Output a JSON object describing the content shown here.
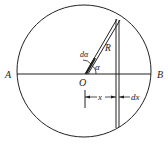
{
  "diagram": {
    "labels": {
      "point_a": "A",
      "point_b": "B",
      "center": "O",
      "radius": "R",
      "angle": "α",
      "angle_increment": "dα",
      "distance": "x",
      "distance_increment": "dx"
    },
    "colors": {
      "stroke": "#222222",
      "background": "#ffffff"
    }
  }
}
